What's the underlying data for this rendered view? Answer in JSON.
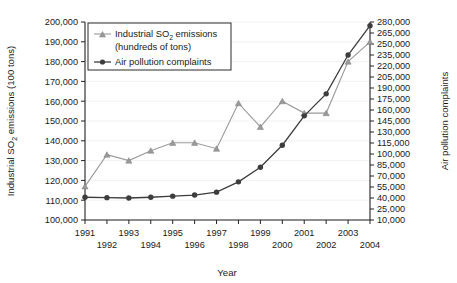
{
  "chart_data": {
    "type": "line",
    "title": "",
    "xlabel": "Year",
    "ylabel": "Industrial SO2 emissions (100 tons)",
    "y2label": "Air pollution complaints",
    "grid": true,
    "legend_position": "top-left",
    "categories": [
      1991,
      1992,
      1993,
      1994,
      1995,
      1996,
      1997,
      1998,
      1999,
      2000,
      2001,
      2002,
      2003,
      2004
    ],
    "x": [
      1991,
      1992,
      1993,
      1994,
      1995,
      1996,
      1997,
      1998,
      1999,
      2000,
      2001,
      2002,
      2003,
      2004
    ],
    "xlim": [
      1991,
      2004
    ],
    "ylim": [
      100000,
      200000
    ],
    "y2lim": [
      10000,
      280000
    ],
    "yticks": [
      100000,
      110000,
      120000,
      130000,
      140000,
      150000,
      160000,
      170000,
      180000,
      190000,
      200000
    ],
    "ytick_labels": [
      "100,000",
      "110,000",
      "120,000",
      "130,000",
      "140,000",
      "150,000",
      "160,000",
      "170,000",
      "180,000",
      "190,000",
      "200,000"
    ],
    "y2ticks": [
      10000,
      25000,
      40000,
      55000,
      70000,
      85000,
      100000,
      115000,
      130000,
      145000,
      160000,
      175000,
      190000,
      205000,
      220000,
      235000,
      250000,
      265000,
      280000
    ],
    "y2tick_labels": [
      "10,000",
      "25,000",
      "40,000",
      "55,000",
      "70,000",
      "85,000",
      "100,000",
      "115,000",
      "130,000",
      "145,000",
      "160,000",
      "175,000",
      "190,000",
      "205,000",
      "220,000",
      "235,000",
      "250,000",
      "265,000",
      "280,000"
    ],
    "xtick_labels": [
      "1991",
      "1992",
      "1993",
      "1994",
      "1995",
      "1996",
      "1997",
      "1998",
      "1999",
      "2000",
      "2001",
      "2002",
      "2003",
      "2004"
    ],
    "series": [
      {
        "name": "Industrial SO2 emissions (hundreds of tons)",
        "axis": "left",
        "color": "#9a9a9a",
        "marker": "triangle",
        "values": [
          117000,
          133000,
          130000,
          135000,
          139000,
          139000,
          136000,
          159000,
          147000,
          160000,
          154000,
          154000,
          180000,
          190000
        ]
      },
      {
        "name": "Air pollution complaints",
        "axis": "right",
        "color": "#3d3d3d",
        "marker": "circle",
        "values": [
          41000,
          40500,
          40000,
          41000,
          42500,
          44000,
          48000,
          62000,
          82000,
          112000,
          152000,
          182000,
          235000,
          275000
        ]
      }
    ]
  },
  "legend": {
    "entries": [
      {
        "label_line1": "Industrial SO",
        "label_sub": "2",
        "label_line1b": " emissions",
        "label_line2": "(hundreds of tons)"
      },
      {
        "label": "Air pollution complaints"
      }
    ],
    "so2_label_main": "Industrial SO",
    "so2_label_sub": "2",
    "so2_label_tail": " emissions",
    "so2_label_second": "(hundreds of tons)",
    "complaints_label": "Air pollution complaints"
  },
  "axes": {
    "ylabel_main": "Industrial SO",
    "ylabel_sub": "2",
    "ylabel_tail": " emissions (100 tons)",
    "y2label": "Air pollution complaints",
    "xlabel": "Year"
  }
}
